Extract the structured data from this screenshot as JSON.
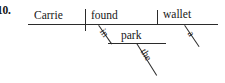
{
  "exercise": {
    "number_label": "10."
  },
  "diagram": {
    "type": "reed-kellogg-sentence-diagram",
    "sentence": "Carrie found a wallet in the park.",
    "baseline": {
      "subject": "Carrie",
      "verb": "found",
      "direct_object": "wallet"
    },
    "modifiers": [
      {
        "word": "a",
        "attaches_to": "wallet",
        "orientation": "slanted"
      },
      {
        "word": "the",
        "attaches_to": "park",
        "orientation": "slanted"
      }
    ],
    "prepositional_phrase": {
      "preposition": "in",
      "object_of_preposition": "park",
      "attaches_to": "found"
    },
    "colors": {
      "line": "#2b2b2b",
      "text": "#171717",
      "background": "#ffffff"
    }
  }
}
